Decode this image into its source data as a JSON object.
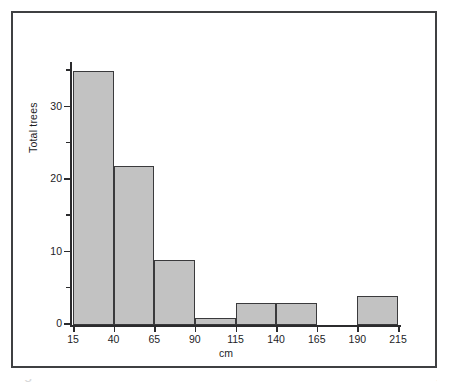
{
  "figure": {
    "frame_color": "#3f4042",
    "background": "#ffffff"
  },
  "caption": {
    "text": "Figure 1.5   The distribution of different diameters at breast height",
    "visible": "partially-cropped"
  },
  "chart_data": {
    "type": "bar",
    "title": "",
    "subtitle": "",
    "xlabel": "cm",
    "ylabel": "Total trees",
    "categories": [
      "15-40",
      "40-65",
      "65-90",
      "90-115",
      "115-140",
      "140-165",
      "165-190",
      "190-215"
    ],
    "bin_edges": [
      15,
      40,
      65,
      90,
      115,
      140,
      165,
      190,
      215
    ],
    "values": [
      35,
      22,
      9,
      1,
      3,
      3,
      0,
      4
    ],
    "bar_color": "#c2c2c2",
    "bar_edge_color": "#3a3a3c",
    "xlim": [
      15,
      215
    ],
    "ylim": [
      0,
      36
    ],
    "grid": false,
    "legend": false,
    "x_ticks": [
      "15",
      "40",
      "65",
      "90",
      "115",
      "140",
      "165",
      "190",
      "215"
    ],
    "x_tick_values": [
      15,
      40,
      65,
      90,
      115,
      140,
      165,
      190,
      215
    ],
    "y_ticks_major": [
      "0",
      "10",
      "20",
      "30"
    ],
    "y_tick_major_values": [
      0,
      10,
      20,
      30
    ],
    "y_tick_minor_values": [
      5,
      15,
      25,
      35
    ]
  }
}
